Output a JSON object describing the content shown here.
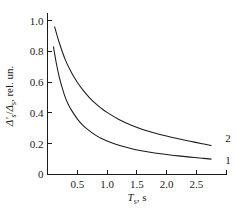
{
  "chart_data": {
    "type": "line",
    "title": "",
    "xlabel": "T_s, s",
    "xlabel_parts": {
      "symbol": "T",
      "subscript": "s",
      "separator": ", ",
      "unit": "s"
    },
    "ylabel": "Δ′s/Δs, rel. un.",
    "ylabel_parts": {
      "numerator": "Δ′",
      "numerator_sub": "s",
      "slash": "/",
      "denominator": "Δ",
      "denominator_sub": "s",
      "suffix": ", rel. un."
    },
    "xlim": [
      0,
      3.0
    ],
    "ylim": [
      0,
      1.05
    ],
    "xticks": [
      0,
      0.5,
      1.0,
      1.5,
      2.0,
      2.5,
      3.0
    ],
    "xtick_labels": [
      "0",
      "0.5",
      "1.0",
      "1.5",
      "2.0",
      "2.5",
      ""
    ],
    "yticks": [
      0,
      0.2,
      0.4,
      0.6,
      0.8,
      1.0
    ],
    "ytick_labels": [
      "0",
      "0.2",
      "0.4",
      "0.6",
      "0.8",
      "1.0"
    ],
    "grid": false,
    "legend_position": "inline-right",
    "line_color": "#1a1a1a",
    "series": [
      {
        "name": "1",
        "label": "1",
        "x": [
          0.1,
          0.15,
          0.2,
          0.25,
          0.3,
          0.35,
          0.4,
          0.5,
          0.6,
          0.7,
          0.8,
          0.9,
          1.0,
          1.2,
          1.4,
          1.6,
          1.8,
          2.0,
          2.2,
          2.4,
          2.6,
          2.75
        ],
        "y": [
          0.83,
          0.72,
          0.63,
          0.56,
          0.5,
          0.455,
          0.42,
          0.362,
          0.318,
          0.285,
          0.258,
          0.236,
          0.218,
          0.19,
          0.169,
          0.153,
          0.14,
          0.13,
          0.121,
          0.113,
          0.106,
          0.1
        ]
      },
      {
        "name": "2",
        "label": "2",
        "x": [
          0.12,
          0.2,
          0.3,
          0.4,
          0.5,
          0.6,
          0.7,
          0.8,
          0.9,
          1.0,
          1.2,
          1.4,
          1.6,
          1.8,
          2.0,
          2.2,
          2.4,
          2.6,
          2.75
        ],
        "y": [
          0.96,
          0.855,
          0.745,
          0.665,
          0.6,
          0.547,
          0.502,
          0.464,
          0.432,
          0.404,
          0.358,
          0.322,
          0.293,
          0.27,
          0.25,
          0.232,
          0.216,
          0.2,
          0.188
        ]
      }
    ]
  }
}
